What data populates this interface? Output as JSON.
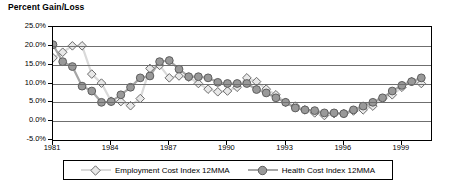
{
  "chart_data": {
    "type": "line",
    "title": "Percent Gain/Loss",
    "xlabel": "",
    "ylabel": "",
    "ylim": [
      -5,
      25
    ],
    "ytick_labels": [
      "25.0%",
      "20.0%",
      "15.0%",
      "10.0%",
      "5.0%",
      "0.0%",
      "-5.0%"
    ],
    "ytick_values": [
      25,
      20,
      15,
      10,
      5,
      0,
      -5
    ],
    "xtick_labels": [
      "1981",
      "1984",
      "1987",
      "1990",
      "1993",
      "1996",
      "1999"
    ],
    "xtick_values": [
      1981,
      1984,
      1987,
      1990,
      1993,
      1996,
      1999
    ],
    "xlim": [
      1981,
      2000.5
    ],
    "grid": true,
    "legend_position": "bottom",
    "x": [
      1981.0,
      1981.5,
      1982.0,
      1982.5,
      1983.0,
      1983.5,
      1984.0,
      1984.5,
      1985.0,
      1985.5,
      1986.0,
      1986.5,
      1987.0,
      1987.5,
      1988.0,
      1988.5,
      1989.0,
      1989.5,
      1990.0,
      1990.5,
      1991.0,
      1991.5,
      1992.0,
      1992.5,
      1993.0,
      1993.5,
      1994.0,
      1994.5,
      1995.0,
      1995.5,
      1996.0,
      1996.5,
      1997.0,
      1997.5,
      1998.0,
      1998.5,
      1999.0,
      1999.5,
      2000.0
    ],
    "series": [
      {
        "name": "Employment Cost Index 12MMA",
        "color": "#d9d9d9",
        "marker": "diamond",
        "marker_fill": "#e8e8e8",
        "values": [
          16.8,
          18.3,
          20.0,
          20.0,
          12.5,
          10.1,
          5.3,
          5.2,
          4.1,
          6.0,
          14.0,
          14.8,
          11.5,
          12.0,
          11.7,
          10.0,
          8.5,
          7.8,
          8.0,
          9.0,
          11.5,
          10.5,
          8.5,
          7.0,
          5.0,
          4.0,
          3.0,
          2.2,
          1.5,
          2.0,
          2.0,
          2.7,
          3.0,
          4.0,
          6.0,
          7.0,
          9.0,
          10.5,
          10.0
        ]
      },
      {
        "name": "Health Cost Index 12MMA",
        "color": "#a6a6a6",
        "marker": "circle",
        "marker_fill": "#999999",
        "values": [
          20.3,
          15.8,
          14.5,
          9.3,
          8.0,
          5.0,
          5.2,
          7.0,
          9.0,
          11.5,
          12.0,
          15.8,
          16.1,
          13.8,
          11.8,
          11.8,
          11.5,
          10.3,
          10.0,
          10.0,
          10.0,
          8.4,
          7.5,
          6.2,
          5.0,
          3.5,
          3.0,
          2.8,
          2.2,
          2.2,
          2.0,
          3.0,
          4.0,
          5.0,
          6.2,
          8.0,
          9.5,
          10.5,
          11.5
        ]
      }
    ]
  },
  "legend": {
    "entries": [
      {
        "label": "Employment  Cost Index 12MMA"
      },
      {
        "label": "Health  Cost Index 12MMA"
      }
    ]
  }
}
